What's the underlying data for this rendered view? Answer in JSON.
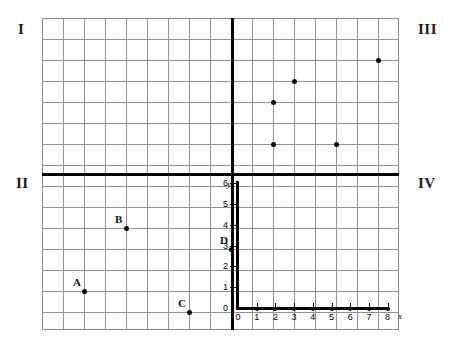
{
  "figure": {
    "type": "coordinate-grid-worksheet",
    "grid": {
      "cell_size_px": 21,
      "columns": 17,
      "rows": 15,
      "origin_crossing": {
        "x_px": 232,
        "y_px": 174
      }
    },
    "quadrant_labels": [
      {
        "name": "quadrant-label-I",
        "text": "I",
        "position": "top-left"
      },
      {
        "name": "quadrant-label-III",
        "text": "III",
        "position": "top-right"
      },
      {
        "name": "quadrant-label-II",
        "text": "II",
        "position": "middle-left"
      },
      {
        "name": "quadrant-label-IV",
        "text": "IV",
        "position": "middle-right"
      }
    ]
  },
  "chart_data": {
    "type": "scatter",
    "title": "",
    "xlabel": "x",
    "ylabel": "y",
    "xlim": [
      0,
      8
    ],
    "ylim": [
      0,
      6
    ],
    "grid": true,
    "legend": null,
    "x_ticks": [
      "0",
      "1",
      "2",
      "3",
      "4",
      "5",
      "6",
      "7",
      "8"
    ],
    "y_ticks": [
      "0",
      "1",
      "2",
      "3",
      "4",
      "5",
      "6"
    ],
    "series": [
      {
        "name": "labeled-points",
        "region": "quadrant-II",
        "points": [
          {
            "label": "A",
            "grid_col": 2,
            "grid_row": 13
          },
          {
            "label": "B",
            "grid_col": 4,
            "grid_row": 10
          },
          {
            "label": "C",
            "grid_col": 7,
            "grid_row": 14
          },
          {
            "label": "D",
            "grid_col": 9,
            "grid_row": 11
          }
        ]
      },
      {
        "name": "unlabeled-points",
        "region": "quadrant-III",
        "points": [
          {
            "label": "",
            "grid_col": 11,
            "grid_row": 6
          },
          {
            "label": "",
            "grid_col": 11,
            "grid_row": 4
          },
          {
            "label": "",
            "grid_col": 12,
            "grid_row": 3
          },
          {
            "label": "",
            "grid_col": 14,
            "grid_row": 6
          },
          {
            "label": "",
            "grid_col": 16,
            "grid_row": 2
          }
        ]
      }
    ]
  },
  "axes": {
    "x_axis_label": "x",
    "y_axis_label": "y",
    "x_tick_labels": [
      "0",
      "1",
      "2",
      "3",
      "4",
      "5",
      "6",
      "7",
      "8"
    ],
    "y_tick_labels": [
      "0",
      "1",
      "2",
      "3",
      "4",
      "5",
      "6"
    ]
  },
  "colors": {
    "grid_line": "#8f8f8f",
    "axis": "#000000",
    "point": "#000000",
    "text": "#111111",
    "background": "#ffffff"
  }
}
